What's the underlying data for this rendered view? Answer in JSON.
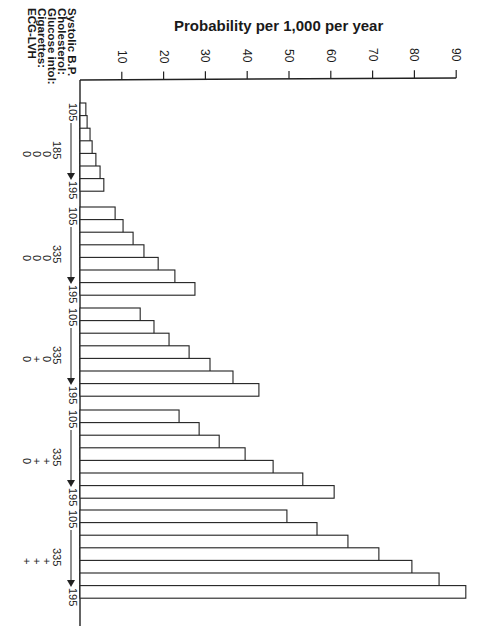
{
  "chart_data": {
    "type": "bar",
    "orientation": "image rotated 90deg clockwise; bars extend to the right on screen",
    "title": "Probability per 1,000 per year",
    "ylabel": "Probability per 1,000 per year",
    "xlabel": "",
    "ylim": [
      0,
      90
    ],
    "yticks": [
      10,
      20,
      30,
      40,
      50,
      60,
      70,
      80,
      90
    ],
    "grid": false,
    "legend": null,
    "factor_labels": [
      "Systolic B.P.",
      "Cholesterol:",
      "Glucose intol:",
      "Cigarettes:",
      "ECG-LVH"
    ],
    "bp_range": {
      "from": "105",
      "to": "195"
    },
    "groups": [
      {
        "name": "Group 1",
        "bp_from": "105",
        "bp_to": "195",
        "cholesterol": "185",
        "glucose_intol": "0",
        "cigarettes": "0",
        "ecg_lvh": "0",
        "values": [
          1.4,
          1.7,
          2.4,
          2.9,
          3.8,
          4.8,
          5.7
        ]
      },
      {
        "name": "Group 2",
        "bp_from": "105",
        "bp_to": "195",
        "cholesterol": "335",
        "glucose_intol": "0",
        "cigarettes": "0",
        "ecg_lvh": "0",
        "values": [
          8.4,
          10.3,
          12.7,
          15.3,
          18.7,
          22.7,
          27.5
        ]
      },
      {
        "name": "Group 3",
        "bp_from": "105",
        "bp_to": "195",
        "cholesterol": "335",
        "glucose_intol": "0",
        "cigarettes": "+",
        "ecg_lvh": "0",
        "values": [
          14.4,
          17.7,
          21.3,
          26.1,
          31.1,
          36.6,
          42.8
        ]
      },
      {
        "name": "Group 4",
        "bp_from": "105",
        "bp_to": "195",
        "cholesterol": "335",
        "glucose_intol": "+",
        "cigarettes": "+",
        "ecg_lvh": "0",
        "values": [
          23.7,
          28.5,
          33.3,
          39.5,
          46.2,
          53.3,
          60.8
        ]
      },
      {
        "name": "Group 5",
        "bp_from": "105",
        "bp_to": "195",
        "cholesterol": "335",
        "glucose_intol": "+",
        "cigarettes": "+",
        "ecg_lvh": "+",
        "values": [
          49.5,
          56.7,
          64.1,
          71.5,
          79.4,
          85.9,
          92.3
        ]
      }
    ]
  },
  "layout": {
    "axis_x": 80,
    "px_per_unit": 4.18,
    "axis_top": 80,
    "axis_bottom": 626,
    "group_tops": [
      103,
      207,
      308,
      410,
      510
    ],
    "bar_step": 12.6,
    "line_color": "#222222"
  }
}
